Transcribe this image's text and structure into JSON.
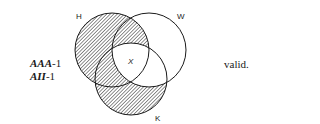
{
  "forms": [
    {
      "mood": "AAA",
      "figure": "-1"
    },
    {
      "mood": "AII",
      "figure": "-1"
    }
  ],
  "verdict": "valid.",
  "diagram": {
    "circles": [
      {
        "label": "H",
        "cx": 112,
        "cy": 50,
        "r": 37,
        "label_x": 76,
        "label_y": 19
      },
      {
        "label": "W",
        "cx": 149,
        "cy": 50,
        "r": 37,
        "label_x": 177,
        "label_y": 19
      },
      {
        "label": "K",
        "cx": 131,
        "cy": 79,
        "r": 36,
        "label_x": 155,
        "label_y": 121
      }
    ],
    "mark": {
      "text": "X",
      "x": 131,
      "y": 64
    },
    "shaded_regions": [
      "H only",
      "H∩W not K",
      "H∩K not W",
      "K only"
    ],
    "stroke_color": "#1a1a1a",
    "hatch_color": "#333333"
  }
}
